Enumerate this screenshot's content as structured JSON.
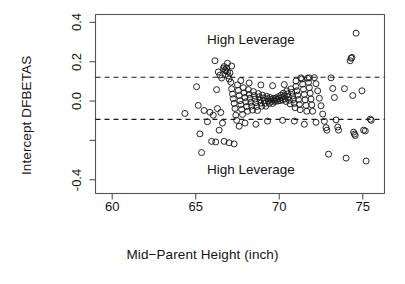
{
  "chart_data": {
    "type": "scatter",
    "title": "",
    "xlabel": "Mid−Parent Height (inch)",
    "ylabel": "Intercept DFBETAS",
    "xlim": [
      59.0,
      76.3
    ],
    "ylim": [
      -0.47,
      0.44
    ],
    "xticks": [
      60,
      65,
      70,
      75
    ],
    "xtick_labels": [
      "60",
      "65",
      "70",
      "75"
    ],
    "yticks": [
      0.4,
      0.2,
      0.0,
      -0.2,
      -0.4
    ],
    "ytick_labels": [
      "0.4",
      "0.2",
      "0.0",
      "",
      "-0.4"
    ],
    "grid": false,
    "legend": null,
    "marker": "open-circle",
    "marker_color": "#1a1a1a",
    "marker_size": 3.0,
    "annotations": [
      {
        "text": "High Leverage",
        "x": 68.3,
        "y": 0.305
      },
      {
        "text": "High Leverage",
        "x": 68.3,
        "y": -0.355
      }
    ],
    "threshold_lines": [
      {
        "label": "upper cutoff",
        "y": 0.121,
        "style": "dashed",
        "color": "#1a1a1a"
      },
      {
        "label": "lower cutoff",
        "y": -0.093,
        "style": "dashed",
        "color": "#1a1a1a"
      }
    ],
    "points": [
      [
        64.35,
        -0.063
      ],
      [
        65.05,
        0.073
      ],
      [
        65.15,
        -0.022
      ],
      [
        65.25,
        -0.167
      ],
      [
        65.35,
        -0.262
      ],
      [
        65.5,
        -0.048
      ],
      [
        65.85,
        -0.057
      ],
      [
        65.95,
        -0.205
      ],
      [
        66.15,
        0.205
      ],
      [
        66.2,
        -0.208
      ],
      [
        66.3,
        -0.038
      ],
      [
        66.35,
        0.148
      ],
      [
        66.45,
        0.132
      ],
      [
        66.5,
        -0.058
      ],
      [
        66.55,
        0.117
      ],
      [
        66.6,
        -0.112
      ],
      [
        66.65,
        0.165
      ],
      [
        66.7,
        0.175
      ],
      [
        66.75,
        0.158
      ],
      [
        66.8,
        0.153
      ],
      [
        66.85,
        0.168
      ],
      [
        66.9,
        0.148
      ],
      [
        66.95,
        0.128
      ],
      [
        67.0,
        0.112
      ],
      [
        67.05,
        0.143
      ],
      [
        67.1,
        0.096
      ],
      [
        67.15,
        0.062
      ],
      [
        67.2,
        0.035
      ],
      [
        67.25,
        0.012
      ],
      [
        67.3,
        -0.012
      ],
      [
        67.35,
        -0.038
      ],
      [
        67.4,
        -0.072
      ],
      [
        67.45,
        -0.098
      ],
      [
        67.5,
        0.082
      ],
      [
        67.55,
        0.054
      ],
      [
        67.6,
        0.028
      ],
      [
        67.65,
        0.002
      ],
      [
        67.7,
        -0.018
      ],
      [
        67.75,
        -0.042
      ],
      [
        67.8,
        -0.068
      ],
      [
        67.85,
        0.068
      ],
      [
        67.9,
        0.042
      ],
      [
        67.95,
        0.018
      ],
      [
        68.0,
        -0.004
      ],
      [
        68.05,
        -0.028
      ],
      [
        68.1,
        -0.052
      ],
      [
        68.15,
        0.058
      ],
      [
        68.2,
        0.034
      ],
      [
        68.25,
        0.014
      ],
      [
        68.3,
        -0.006
      ],
      [
        68.35,
        -0.026
      ],
      [
        68.4,
        -0.046
      ],
      [
        68.45,
        0.048
      ],
      [
        68.5,
        0.028
      ],
      [
        68.55,
        0.01
      ],
      [
        68.6,
        -0.008
      ],
      [
        68.65,
        -0.028
      ],
      [
        68.7,
        -0.048
      ],
      [
        68.75,
        0.038
      ],
      [
        68.8,
        0.022
      ],
      [
        68.85,
        0.006
      ],
      [
        68.9,
        -0.01
      ],
      [
        68.95,
        -0.026
      ],
      [
        69.0,
        0.03
      ],
      [
        69.05,
        0.016
      ],
      [
        69.1,
        0.002
      ],
      [
        69.15,
        -0.012
      ],
      [
        69.2,
        -0.026
      ],
      [
        69.25,
        0.024
      ],
      [
        69.3,
        0.012
      ],
      [
        69.35,
        0.0
      ],
      [
        69.4,
        -0.012
      ],
      [
        69.45,
        0.018
      ],
      [
        69.5,
        0.008
      ],
      [
        69.55,
        -0.002
      ],
      [
        69.6,
        -0.012
      ],
      [
        69.65,
        0.014
      ],
      [
        69.7,
        0.006
      ],
      [
        69.75,
        -0.002
      ],
      [
        69.8,
        0.016
      ],
      [
        69.85,
        0.008
      ],
      [
        69.9,
        0.0
      ],
      [
        69.95,
        0.022
      ],
      [
        70.0,
        0.012
      ],
      [
        70.05,
        0.002
      ],
      [
        70.1,
        0.03
      ],
      [
        70.15,
        0.018
      ],
      [
        70.2,
        0.006
      ],
      [
        70.25,
        0.04
      ],
      [
        70.3,
        0.026
      ],
      [
        70.35,
        0.012
      ],
      [
        70.4,
        -0.002
      ],
      [
        70.45,
        0.052
      ],
      [
        70.5,
        0.036
      ],
      [
        70.55,
        0.02
      ],
      [
        70.6,
        0.004
      ],
      [
        70.65,
        -0.014
      ],
      [
        70.7,
        0.062
      ],
      [
        70.75,
        0.044
      ],
      [
        70.8,
        0.026
      ],
      [
        70.85,
        0.008
      ],
      [
        70.9,
        -0.012
      ],
      [
        70.95,
        -0.034
      ],
      [
        71.0,
        0.074
      ],
      [
        71.05,
        0.052
      ],
      [
        71.1,
        0.03
      ],
      [
        71.15,
        0.008
      ],
      [
        71.2,
        -0.018
      ],
      [
        71.25,
        -0.044
      ],
      [
        71.3,
        0.118
      ],
      [
        71.35,
        0.112
      ],
      [
        71.4,
        0.086
      ],
      [
        71.45,
        0.06
      ],
      [
        71.5,
        0.034
      ],
      [
        71.55,
        0.006
      ],
      [
        71.6,
        -0.022
      ],
      [
        71.65,
        -0.052
      ],
      [
        71.7,
        0.116
      ],
      [
        71.75,
        0.094
      ],
      [
        71.8,
        0.068
      ],
      [
        71.85,
        0.04
      ],
      [
        71.9,
        0.01
      ],
      [
        71.95,
        -0.02
      ],
      [
        72.0,
        -0.052
      ],
      [
        72.1,
        0.119
      ],
      [
        72.2,
        0.088
      ],
      [
        72.3,
        0.052
      ],
      [
        72.4,
        0.014
      ],
      [
        72.5,
        -0.024
      ],
      [
        72.6,
        -0.066
      ],
      [
        72.7,
        -0.103
      ],
      [
        72.8,
        -0.135
      ],
      [
        72.85,
        -0.148
      ],
      [
        72.95,
        -0.27
      ],
      [
        73.1,
        0.118
      ],
      [
        73.2,
        0.064
      ],
      [
        73.3,
        0.018
      ],
      [
        73.4,
        -0.096
      ],
      [
        73.5,
        -0.132
      ],
      [
        73.55,
        -0.148
      ],
      [
        73.9,
        0.063
      ],
      [
        74.0,
        -0.29
      ],
      [
        74.25,
        0.205
      ],
      [
        74.3,
        0.218
      ],
      [
        74.35,
        0.222
      ],
      [
        74.4,
        0.028
      ],
      [
        74.45,
        -0.158
      ],
      [
        74.5,
        -0.168
      ],
      [
        74.55,
        -0.175
      ],
      [
        74.6,
        0.345
      ],
      [
        74.95,
        0.052
      ],
      [
        75.05,
        -0.148
      ],
      [
        75.15,
        -0.152
      ],
      [
        75.2,
        -0.305
      ],
      [
        75.45,
        -0.092
      ],
      [
        75.5,
        -0.098
      ],
      [
        66.25,
        0.058
      ],
      [
        66.4,
        -0.148
      ],
      [
        66.7,
        -0.205
      ],
      [
        67.0,
        -0.212
      ],
      [
        67.6,
        -0.128
      ],
      [
        67.3,
        -0.218
      ],
      [
        67.95,
        -0.112
      ],
      [
        68.6,
        -0.118
      ],
      [
        69.3,
        -0.102
      ],
      [
        70.2,
        -0.098
      ],
      [
        70.9,
        -0.102
      ],
      [
        71.5,
        -0.118
      ],
      [
        72.2,
        -0.108
      ],
      [
        65.7,
        -0.105
      ],
      [
        66.05,
        -0.072
      ],
      [
        67.7,
        0.104
      ],
      [
        68.2,
        0.092
      ],
      [
        68.9,
        0.082
      ],
      [
        69.6,
        0.078
      ],
      [
        70.3,
        0.084
      ],
      [
        71.0,
        0.102
      ],
      [
        71.8,
        0.118
      ],
      [
        66.9,
        0.192
      ],
      [
        67.15,
        0.178
      ]
    ]
  }
}
